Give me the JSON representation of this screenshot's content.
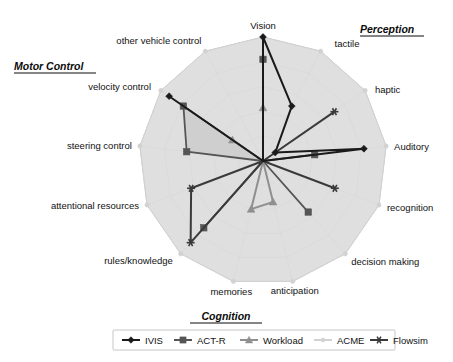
{
  "chart_data": {
    "type": "radar",
    "title": "",
    "categories": [
      "Vision",
      "tactile",
      "haptic",
      "Auditory",
      "recognition",
      "decision making",
      "anticipation",
      "memories",
      "rules/knowledge",
      "attentional resources",
      "steering control",
      "velocity control",
      "other vehicle control"
    ],
    "axis_count": 13,
    "rings": 5,
    "rmin": 0,
    "rmax": 1,
    "grid": true,
    "legend_position": "bottom",
    "series": [
      {
        "name": "IVIS",
        "color": "#1a1a1a",
        "marker": "diamond",
        "fill": "none",
        "values": [
          1.0,
          0.5,
          0.12,
          0.82,
          0.0,
          0.0,
          0.0,
          0.0,
          0.0,
          0.0,
          0.0,
          0.92,
          0.0
        ]
      },
      {
        "name": "ACT-R",
        "color": "#555555",
        "marker": "square",
        "fill": "#c9c9c9",
        "values": [
          0.82,
          0.0,
          0.0,
          0.42,
          0.0,
          0.55,
          0.0,
          0.0,
          0.72,
          0.0,
          0.62,
          0.78,
          0.0
        ]
      },
      {
        "name": "Workload",
        "color": "#8f8f8f",
        "marker": "triangle",
        "fill": "none",
        "values": [
          0.43,
          0.0,
          0.0,
          0.0,
          0.0,
          0.0,
          0.34,
          0.4,
          0.0,
          0.0,
          0.0,
          0.3,
          0.0
        ]
      },
      {
        "name": "ACME",
        "color": "#d2d2d2",
        "marker": "dot",
        "fill": "#d9d9d9",
        "values": [
          1.0,
          1.0,
          1.0,
          1.0,
          1.0,
          1.0,
          1.0,
          1.0,
          1.0,
          1.0,
          1.0,
          1.0,
          1.0
        ]
      },
      {
        "name": "Flowsim",
        "color": "#3a3a3a",
        "marker": "asterisk",
        "fill": "none",
        "values": [
          0.0,
          0.0,
          0.7,
          0.0,
          0.62,
          0.0,
          0.0,
          0.0,
          0.88,
          0.62,
          0.0,
          0.0,
          0.0
        ]
      }
    ]
  },
  "groups": [
    {
      "label": "Perception",
      "key": "perception"
    },
    {
      "label": "Motor Control",
      "key": "motor_control"
    },
    {
      "label": "Cognition",
      "key": "cognition"
    }
  ],
  "axis_labels": {
    "vision": "Vision",
    "tactile": "tactile",
    "haptic": "haptic",
    "auditory": "Auditory",
    "recognition": "recognition",
    "decision_making": "decision making",
    "anticipation": "anticipation",
    "memories": "memories",
    "rules_knowledge": "rules/knowledge",
    "attentional_resources": "attentional resources",
    "steering_control": "steering control",
    "velocity_control": "velocity control",
    "other_vehicle_control": "other vehicle control"
  },
  "legend": {
    "entries": [
      {
        "label": "IVIS",
        "color": "#1a1a1a",
        "marker": "diamond"
      },
      {
        "label": "ACT-R",
        "color": "#555555",
        "marker": "square"
      },
      {
        "label": "Workload",
        "color": "#8f8f8f",
        "marker": "triangle"
      },
      {
        "label": "ACME",
        "color": "#d2d2d2",
        "marker": "dot"
      },
      {
        "label": "Flowsim",
        "color": "#3a3a3a",
        "marker": "asterisk"
      }
    ]
  },
  "colors": {
    "background": "#ffffff",
    "grid": "#c4c4c4",
    "text": "#111111",
    "acme_fill": "#d9d9d9",
    "actr_fill": "#c9c9c9"
  }
}
